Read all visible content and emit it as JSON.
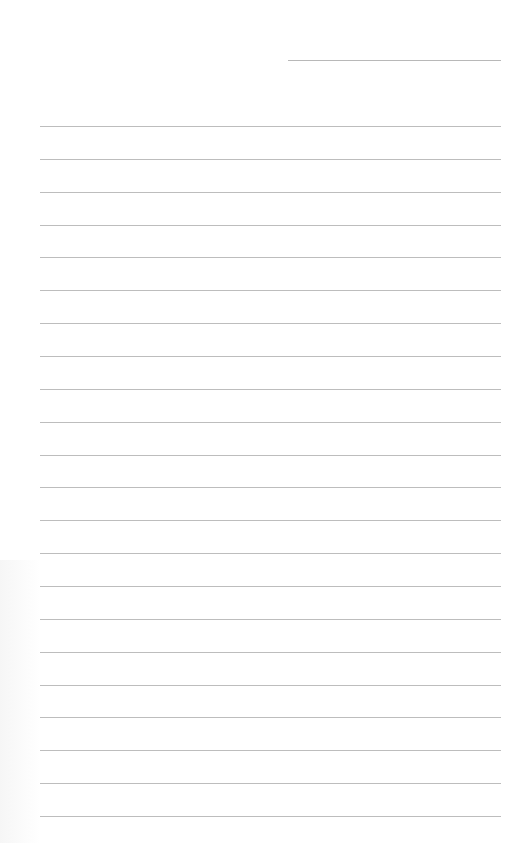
{
  "page": {
    "type": "lined-paper",
    "background_color": "#ffffff",
    "line_color": "#bdbdbd",
    "header_line": {
      "label": ""
    },
    "line_count": 22,
    "lines": [
      {
        "text": ""
      },
      {
        "text": ""
      },
      {
        "text": ""
      },
      {
        "text": ""
      },
      {
        "text": ""
      },
      {
        "text": ""
      },
      {
        "text": ""
      },
      {
        "text": ""
      },
      {
        "text": ""
      },
      {
        "text": ""
      },
      {
        "text": ""
      },
      {
        "text": ""
      },
      {
        "text": ""
      },
      {
        "text": ""
      },
      {
        "text": ""
      },
      {
        "text": ""
      },
      {
        "text": ""
      },
      {
        "text": ""
      },
      {
        "text": ""
      },
      {
        "text": ""
      },
      {
        "text": ""
      },
      {
        "text": ""
      }
    ]
  }
}
